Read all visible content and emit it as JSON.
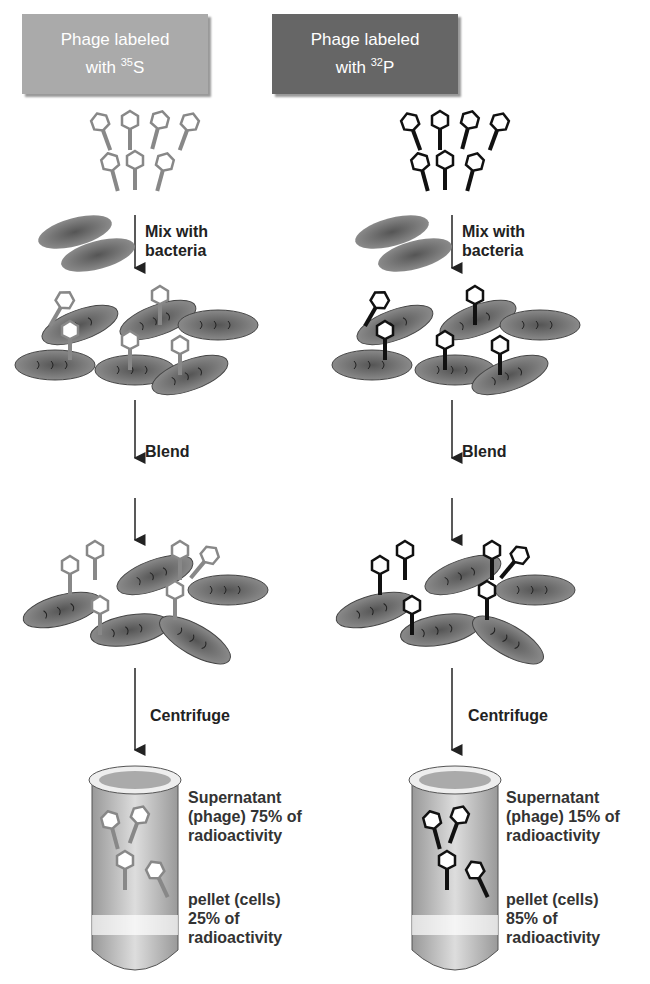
{
  "panels": [
    {
      "id": "sulfur",
      "header": {
        "line1": "Phage labeled",
        "line2_prefix": "with ",
        "isotope_mass": "35",
        "isotope_symbol": "S"
      },
      "phage_color": "#888888",
      "steps": [
        "Mix with bacteria",
        "Blend",
        "Centrifuge"
      ],
      "supernatant": {
        "line1": "Supernatant",
        "line2": "(phage) 75% of",
        "line3": "radioactivity"
      },
      "pellet": {
        "line1": "pellet (cells)",
        "line2": "25% of",
        "line3": "radioactivity"
      }
    },
    {
      "id": "phosphorus",
      "header": {
        "line1": "Phage labeled",
        "line2_prefix": "with ",
        "isotope_mass": "32",
        "isotope_symbol": "P"
      },
      "phage_color": "#111111",
      "steps": [
        "Mix with bacteria",
        "Blend",
        "Centrifuge"
      ],
      "supernatant": {
        "line1": "Supernatant",
        "line2": "(phage) 15% of",
        "line3": "radioactivity"
      },
      "pellet": {
        "line1": "pellet (cells)",
        "line2": "85% of",
        "line3": "radioactivity"
      }
    }
  ],
  "labels": {
    "mix_1": "Mix with",
    "mix_2": "bacteria"
  }
}
